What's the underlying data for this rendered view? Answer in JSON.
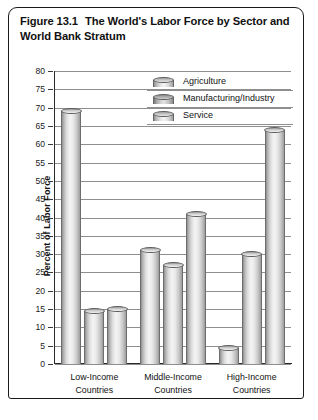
{
  "figure": {
    "number": "Figure 13.1",
    "title": "The World's Labor Force by Sector and World Bank Stratum"
  },
  "legend": {
    "position": "top-right",
    "items": [
      {
        "label": "Agriculture",
        "icon": "cylinder-icon"
      },
      {
        "label": "Manufacturing/Industry",
        "icon": "cylinder-icon"
      },
      {
        "label": "Service",
        "icon": "cylinder-icon"
      }
    ]
  },
  "axes": {
    "ylabel": "Percent of Labor Force",
    "yticks": [
      "80",
      "75",
      "70",
      "65",
      "60",
      "55",
      "50",
      "45",
      "40",
      "35",
      "30",
      "25",
      "20",
      "15",
      "10",
      "5",
      "0"
    ],
    "xticklabels": [
      {
        "line1": "Low-Income",
        "line2": "Countries"
      },
      {
        "line1": "Middle-Income",
        "line2": "Countries"
      },
      {
        "line1": "High-Income",
        "line2": "Countries"
      }
    ]
  },
  "chart_data": {
    "type": "bar",
    "title": "The World's Labor Force by Sector and World Bank Stratum",
    "xlabel": "",
    "ylabel": "Percent of Labor Force",
    "ylim": [
      0,
      80
    ],
    "ytick_step": 5,
    "grid": true,
    "legend_position": "upper right",
    "categories": [
      "Low-Income Countries",
      "Middle-Income Countries",
      "High-Income Countries"
    ],
    "series": [
      {
        "name": "Agriculture",
        "values": [
          69,
          31,
          4.5
        ]
      },
      {
        "name": "Manufacturing/Industry",
        "values": [
          14.5,
          27,
          30
        ]
      },
      {
        "name": "Service",
        "values": [
          15,
          41,
          64
        ]
      }
    ]
  },
  "colors": {
    "frame": "#1a1a1a",
    "gridline": "#8e8e8e",
    "bar_fill": "#e3e3e3",
    "bar_edge": "#6d6d6d",
    "text": "#111111",
    "background": "#ffffff"
  }
}
